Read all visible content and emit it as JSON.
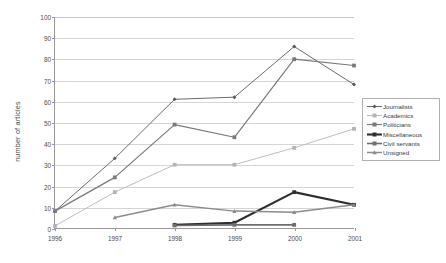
{
  "chart_data": {
    "type": "line",
    "title": "",
    "xlabel": "",
    "ylabel": "number of articles",
    "categories": [
      "1996",
      "1997",
      "1998",
      "1999",
      "2000",
      "2001"
    ],
    "x": [
      1996,
      1997,
      1998,
      1999,
      2000,
      2001
    ],
    "ylim": [
      0,
      100
    ],
    "ytick_values": [
      0,
      10,
      20,
      30,
      40,
      50,
      60,
      70,
      80,
      90,
      100
    ],
    "ytick_labels": [
      "0",
      "10",
      "20",
      "30",
      "40",
      "50",
      "60",
      "70",
      "80",
      "90",
      "100"
    ],
    "grid": "horizontal",
    "legend_position": "right",
    "series": [
      {
        "name": "Journalists",
        "values": [
          8,
          33,
          61,
          62,
          86,
          68
        ],
        "color": "#5a5a5a",
        "width": 0.9,
        "marker": "diamond"
      },
      {
        "name": "Academics",
        "values": [
          1,
          17,
          30,
          30,
          38,
          47
        ],
        "color": "#b4b4b4",
        "width": 0.9,
        "marker": "square"
      },
      {
        "name": "Politicians",
        "values": [
          8,
          24,
          49,
          43,
          80,
          77
        ],
        "color": "#7a7a7a",
        "width": 1.2,
        "marker": "square"
      },
      {
        "name": "Miscellaneous",
        "values": [
          null,
          null,
          1.5,
          2.5,
          17,
          11
        ],
        "color": "#2e2e2e",
        "width": 2.1,
        "marker": "square"
      },
      {
        "name": "Civil servants",
        "values": [
          null,
          null,
          1.2,
          1.5,
          1.5,
          null
        ],
        "color": "#6e6e6e",
        "width": 1.6,
        "marker": "square"
      },
      {
        "name": "Unsigned",
        "values": [
          null,
          5,
          11,
          8,
          7.5,
          11
        ],
        "color": "#8c8c8c",
        "width": 1.5,
        "marker": "triangle"
      }
    ]
  },
  "legend": {
    "items": [
      {
        "label": "Journalists"
      },
      {
        "label": "Academics"
      },
      {
        "label": "Politicians"
      },
      {
        "label": "Miscellaneous"
      },
      {
        "label": "Civil servants"
      },
      {
        "label": "Unsigned"
      }
    ]
  }
}
